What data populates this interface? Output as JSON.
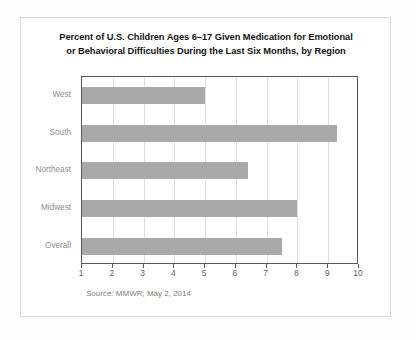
{
  "chart_data": {
    "type": "bar",
    "orientation": "horizontal",
    "title": "Percent of U.S. Children Ages 6–17 Given Medication for Emotional or Behavioral Difficulties During the Last Six Months, by Region",
    "title_lines": [
      "Percent of U.S. Children Ages 6–17 Given Medication for Emotional",
      "or Behavioral Difficulties During the Last Six Months, by Region"
    ],
    "categories": [
      "West",
      "South",
      "Northeast",
      "Midwest",
      "Overall"
    ],
    "values": [
      5.0,
      9.3,
      6.4,
      8.0,
      7.5
    ],
    "xlabel": "",
    "ylabel": "",
    "xlim": [
      1,
      10
    ],
    "xticks": [
      1,
      2,
      3,
      4,
      5,
      6,
      7,
      8,
      9,
      10
    ],
    "xtick_labels": [
      "1",
      "2",
      "3",
      "4",
      "5",
      "6",
      "7",
      "8",
      "9",
      "10"
    ],
    "grid": "vertical",
    "legend": "none",
    "bar_color": "#a9a9a9",
    "gridline_color": "#dedede",
    "axis_color": "#575757"
  },
  "source": {
    "lead": "Source:",
    "text": " MMWR, May 2, 2014"
  }
}
